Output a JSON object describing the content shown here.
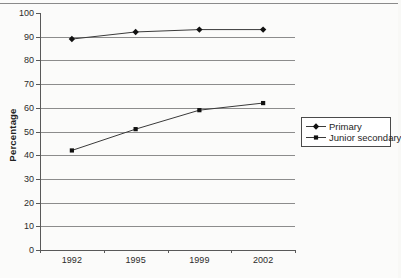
{
  "page": {
    "background": "#fbfbfa",
    "top_rule_color": "#8a8a8a"
  },
  "chart_data": {
    "type": "line",
    "title": "",
    "xlabel": "",
    "ylabel": "Percentage",
    "categories": [
      "1992",
      "1995",
      "1999",
      "2002"
    ],
    "series": [
      {
        "name": "Primary",
        "marker": "diamond",
        "values": [
          89,
          92,
          93,
          93
        ]
      },
      {
        "name": "Junior secondary",
        "marker": "square",
        "values": [
          42,
          51,
          59,
          62
        ]
      }
    ],
    "ylim": [
      0,
      100
    ],
    "y_ticks": [
      0,
      10,
      20,
      30,
      40,
      50,
      60,
      70,
      80,
      90,
      100
    ],
    "grid": true,
    "legend_position": "right-middle",
    "colors": {
      "line": "#3a3a3a",
      "grid": "#8c8c8c",
      "axis": "#595959",
      "marker": "#111111",
      "text": "#2b2b2b"
    }
  }
}
